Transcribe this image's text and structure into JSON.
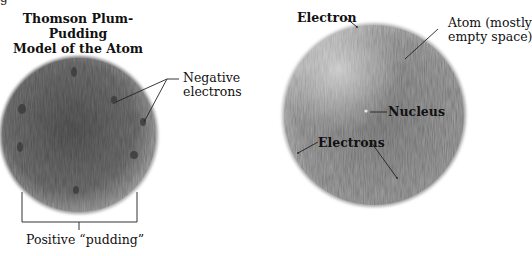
{
  "figure_fragment": "g",
  "left_panel": {
    "title_line1": "Thomson Plum-Pudding",
    "title_line2": "Model of the Atom",
    "label_electrons_line1": "Negative",
    "label_electrons_line2": "electrons",
    "label_pudding": "Positive “pudding”"
  },
  "right_panel": {
    "label_electron": "Electron",
    "label_atom_line1": "Atom (mostly",
    "label_atom_line2": "empty space)",
    "label_nucleus": "Nucleus",
    "label_electrons": "Electrons"
  },
  "colors": {
    "left_sphere": "#6e6e6e",
    "right_sphere": "#9a9a9a",
    "line": "#222222"
  }
}
